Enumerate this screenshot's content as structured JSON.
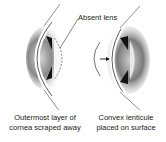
{
  "diagram": {
    "callout": "Absent lens",
    "left_panel": {
      "caption_line1": "Outermost layer of",
      "caption_line2": "cornea scraped away"
    },
    "right_panel": {
      "caption_line1": "Convex lenticule",
      "caption_line2": "placed on surface"
    }
  },
  "colors": {
    "background": "#ffffff",
    "ink": "#222222",
    "shade": "#555555"
  }
}
